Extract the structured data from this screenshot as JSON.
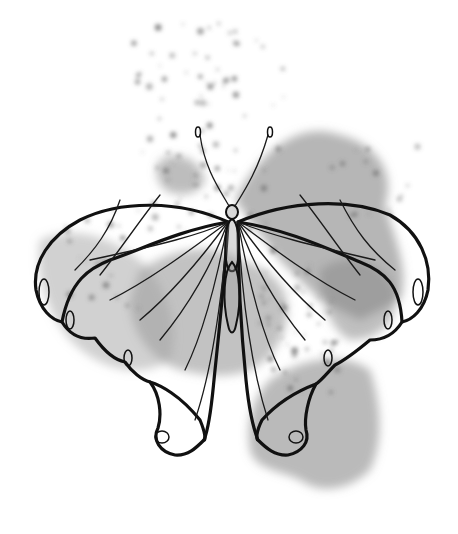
{
  "artwork": {
    "subject": "butterfly line drawing over gray watercolor splashes",
    "colors": {
      "background": "#ffffff",
      "line": "#111111",
      "wash_dark": "#7a7a7a",
      "wash_mid": "#9a9a9a",
      "wash_light": "#bdbdbd"
    }
  }
}
